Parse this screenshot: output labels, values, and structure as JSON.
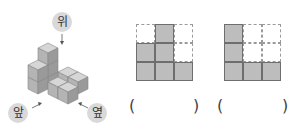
{
  "figure": {
    "labels": {
      "top": "위",
      "front": "앞",
      "side": "옆"
    },
    "colors": {
      "cube_top": "#d6d6d6",
      "cube_left": "#b4b4b4",
      "cube_right": "#9a9a9a",
      "grid_fill": "#bdbdbd",
      "grid_line": "#6e6e6e",
      "dashed": "#9a9a9a"
    }
  },
  "views": [
    {
      "name": "view-1",
      "grid": [
        [
          0,
          1,
          0
        ],
        [
          1,
          1,
          0
        ],
        [
          1,
          1,
          1
        ]
      ],
      "answer_open": "(",
      "answer_close": ")"
    },
    {
      "name": "view-2",
      "grid": [
        [
          1,
          0,
          0
        ],
        [
          1,
          0,
          0
        ],
        [
          1,
          1,
          1
        ]
      ],
      "answer_open": "(",
      "answer_close": ")"
    }
  ]
}
